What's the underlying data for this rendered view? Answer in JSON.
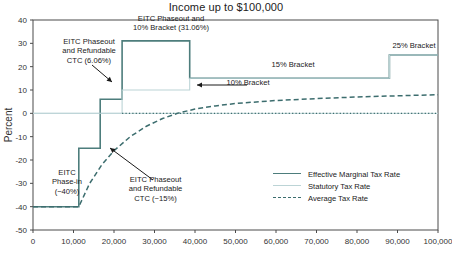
{
  "chart_data": {
    "type": "line",
    "title": "Income up to $100,000",
    "xlabel": "",
    "ylabel": "Percent",
    "xlim": [
      0,
      100000
    ],
    "ylim": [
      -50,
      40
    ],
    "grid": false,
    "x_ticks": [
      "0",
      "10,000",
      "20,000",
      "30,000",
      "40,000",
      "50,000",
      "60,000",
      "70,000",
      "80,000",
      "90,000",
      "100,000"
    ],
    "x_tick_values": [
      0,
      10000,
      20000,
      30000,
      40000,
      50000,
      60000,
      70000,
      80000,
      90000,
      100000
    ],
    "y_ticks": [
      "40",
      "30",
      "20",
      "10",
      "0",
      "-10",
      "-20",
      "-30",
      "-40",
      "-50"
    ],
    "y_tick_values": [
      40,
      30,
      20,
      10,
      0,
      -10,
      -20,
      -30,
      -40,
      -50
    ],
    "legend_position": "bottom-right",
    "series": [
      {
        "name": "Effective Marginal Tax Rate",
        "style": "solid",
        "color": "#4d7d7c",
        "type": "step",
        "points": [
          [
            0,
            -40
          ],
          [
            11300,
            -40
          ],
          [
            11300,
            -15
          ],
          [
            16600,
            -15
          ],
          [
            16600,
            6.06
          ],
          [
            22000,
            6.06
          ],
          [
            22000,
            31.06
          ],
          [
            38700,
            31.06
          ],
          [
            38700,
            15
          ],
          [
            88000,
            15
          ],
          [
            88000,
            25
          ],
          [
            100000,
            25
          ]
        ]
      },
      {
        "name": "Statutory Tax Rate",
        "style": "solid-light",
        "color": "#bcd4d6",
        "type": "step",
        "points": [
          [
            0,
            0
          ],
          [
            22000,
            0
          ],
          [
            22000,
            10
          ],
          [
            38700,
            10
          ],
          [
            38700,
            15
          ],
          [
            88000,
            15
          ],
          [
            88000,
            25
          ],
          [
            100000,
            25
          ]
        ]
      },
      {
        "name": "Average Tax Rate",
        "style": "dashed",
        "color": "#3c6d6e",
        "type": "line",
        "points": [
          [
            0,
            -40
          ],
          [
            2000,
            -40
          ],
          [
            5000,
            -40
          ],
          [
            11300,
            -40
          ],
          [
            14000,
            -30
          ],
          [
            17000,
            -22
          ],
          [
            20000,
            -16
          ],
          [
            24000,
            -10
          ],
          [
            28000,
            -5.5
          ],
          [
            32000,
            -2.2
          ],
          [
            36000,
            0.2
          ],
          [
            40000,
            1.8
          ],
          [
            45000,
            3.2
          ],
          [
            50000,
            4.2
          ],
          [
            60000,
            5.5
          ],
          [
            70000,
            6.3
          ],
          [
            80000,
            7.0
          ],
          [
            90000,
            7.5
          ],
          [
            100000,
            8.0
          ]
        ]
      }
    ],
    "annotations": [
      {
        "name": "eitc-phaseout-ctc-606",
        "text": "EITC Phaseout\nand Refundable\nCTC (6.06%)",
        "arrow_to": [
          16600,
          6.06
        ]
      },
      {
        "name": "eitc-phaseout-10-bracket-3106",
        "text": "EITC Phaseout and\n10% Bracket (31.06%)",
        "arrow_to": null
      },
      {
        "name": "bracket-15",
        "text": "15% Bracket",
        "arrow_to": null
      },
      {
        "name": "bracket-10",
        "text": "10% Bracket",
        "arrow_to": [
          30000,
          10
        ]
      },
      {
        "name": "bracket-25",
        "text": "25% Bracket",
        "arrow_to": null
      },
      {
        "name": "eitc-phase-in",
        "text": "EITC\nPhase-in\n(−40%)",
        "arrow_to": null
      },
      {
        "name": "eitc-phaseout-ctc-neg15",
        "text": "EITC Phaseout\nand Refundable\nCTC (−15%)",
        "arrow_to": [
          16600,
          -15
        ]
      }
    ]
  },
  "colors": {
    "effective_marginal": "#4d7d7c",
    "statutory": "#bcd4d6",
    "average": "#3c6d6e",
    "axis": "#4a4a4a",
    "text": "#1a1a1a"
  },
  "legend": {
    "items": [
      {
        "label": "Effective Marginal Tax Rate",
        "swatch": "solid-line-swatch"
      },
      {
        "label": "Statutory Tax Rate",
        "swatch": "light-line-swatch"
      },
      {
        "label": "Average Tax Rate",
        "swatch": "dashed-line-swatch"
      }
    ]
  },
  "axis": {
    "y_title": "Percent"
  }
}
